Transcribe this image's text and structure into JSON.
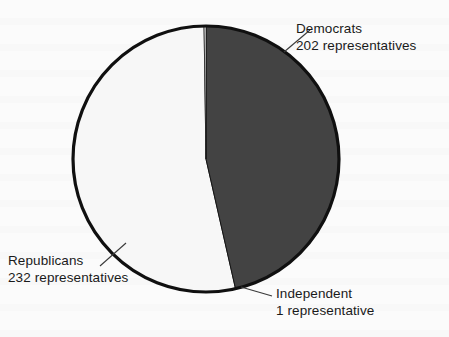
{
  "chart_data": {
    "type": "pie",
    "title": "",
    "subtitle": "",
    "xlabel": "",
    "ylabel": "",
    "legend_position": "callout-labels",
    "grid": false,
    "unit": "representatives",
    "total": 435,
    "categories": [
      "Democrats",
      "Republicans",
      "Independent"
    ],
    "values": [
      202,
      232,
      1
    ],
    "slices": [
      {
        "name": "Democrats",
        "value": 202,
        "unit_label": "202 representatives",
        "color": "#434343",
        "start_angle_deg": 0,
        "end_angle_deg": 167.2,
        "percent": 46.4
      },
      {
        "name": "Independent",
        "value": 1,
        "unit_label": "1 representative",
        "color": "#fbfbfb",
        "start_angle_deg": 167.2,
        "end_angle_deg": 168.0,
        "percent": 0.2
      },
      {
        "name": "Republicans",
        "value": 232,
        "unit_label": "232 representatives",
        "color": "#f7f7f7",
        "start_angle_deg": 168.0,
        "end_angle_deg": 360,
        "percent": 53.3
      }
    ],
    "annotations": [
      {
        "text": "Democrats",
        "detail": "202 representatives"
      },
      {
        "text": "Republicans",
        "detail": "232 representatives"
      },
      {
        "text": "Independent",
        "detail": "1 representative"
      }
    ]
  },
  "labels": {
    "democrats": {
      "name": "Democrats",
      "count": "202 representatives"
    },
    "republicans": {
      "name": "Republicans",
      "count": "232 representatives"
    },
    "independent": {
      "name": "Independent",
      "count": "1 representative"
    }
  },
  "colors": {
    "dark_slice": "#434343",
    "light_slice": "#f7f7f7",
    "outline": "#101010",
    "text": "#1a1a1a",
    "background": "#fbfbfb"
  }
}
